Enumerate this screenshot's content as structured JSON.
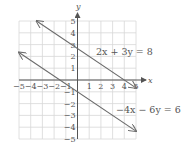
{
  "chart_data": {
    "type": "line",
    "title": "",
    "xlabel": "x",
    "ylabel": "y",
    "xlim": [
      -5,
      5
    ],
    "ylim": [
      -5,
      5
    ],
    "grid": true,
    "x_ticks": [
      -5,
      -4,
      -3,
      -2,
      -1,
      1,
      2,
      3,
      4,
      5
    ],
    "y_ticks": [
      -5,
      -4,
      -3,
      -2,
      -1,
      1,
      2,
      3,
      4,
      5
    ],
    "series": [
      {
        "name": "2x + 3y = 8",
        "equation": "2x + 3y = 8",
        "x": [
          -3.5,
          5
        ],
        "y": [
          5,
          -0.667
        ],
        "arrows": "both"
      },
      {
        "name": "-4x - 6y = 6",
        "equation": "−4x − 6y = 6",
        "x": [
          -5,
          5
        ],
        "y": [
          2.333,
          -4.333
        ],
        "arrows": "both"
      }
    ],
    "annotations": [
      {
        "text": "2x + 3y = 8",
        "x": 3.2,
        "y": 2.4
      },
      {
        "text": "−4x − 6y = 6",
        "x": 4.0,
        "y": -2.3
      }
    ]
  },
  "labels": {
    "x_axis": "x",
    "y_axis": "y",
    "eq1": "2x + 3y = 8",
    "eq2": "−4x − 6y = 6"
  },
  "colors": {
    "grid": "#d8d8d8",
    "axis": "#555555",
    "line": "#6a6a6a",
    "text": "#555555"
  }
}
